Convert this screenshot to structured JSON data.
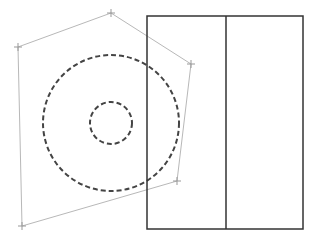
{
  "canvas": {
    "width": 317,
    "height": 244,
    "background": "#ffffff"
  },
  "polygon": {
    "points": [
      [
        111,
        13
      ],
      [
        191,
        64
      ],
      [
        177,
        181
      ],
      [
        22,
        226
      ],
      [
        18,
        47
      ]
    ],
    "stroke": "#b8b8b8",
    "stroke_width": 1,
    "vertex_marker_size": 4
  },
  "circles": [
    {
      "name": "outer-circle",
      "cx": 111,
      "cy": 123,
      "r": 68,
      "stroke": "#444444",
      "stroke_width": 2,
      "dash": "5,3"
    },
    {
      "name": "inner-circle",
      "cx": 111,
      "cy": 123,
      "r": 21,
      "stroke": "#444444",
      "stroke_width": 2,
      "dash": "5,3"
    }
  ],
  "rectangle": {
    "x": 147,
    "y": 16,
    "width": 156,
    "height": 213,
    "stroke": "#333333",
    "stroke_width": 1.5,
    "divider_x": 226
  }
}
